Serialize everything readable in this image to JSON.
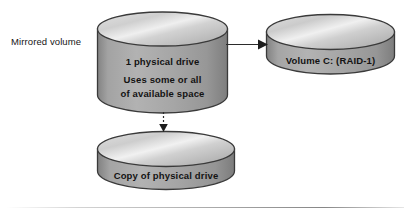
{
  "diagram": {
    "title": "Mirrored volume",
    "type": "storage-volume-diagram",
    "background_color": "#ffffff",
    "shape_fill_light": "#d7d7d7",
    "shape_fill_dark": "#9a9a9a",
    "outline_color": "#3d3d3d",
    "text_color": "#131313"
  },
  "labels": {
    "side_label": "Mirrored volume"
  },
  "nodes": {
    "source_drive": {
      "shape": "cylinder",
      "line1": "1 physical drive",
      "line2": "Uses some or all",
      "line3": "of available space"
    },
    "target_volume": {
      "shape": "cylinder",
      "line1": "Volume C: (RAID-1)"
    },
    "mirror_copy": {
      "shape": "cylinder",
      "line1": "Copy of physical drive"
    }
  },
  "connectors": {
    "source_to_volume": {
      "style": "solid",
      "direction": "right",
      "arrowhead": "filled-triangle"
    },
    "source_to_copy": {
      "style": "dashed",
      "direction": "down",
      "arrowhead": "filled-triangle"
    }
  }
}
